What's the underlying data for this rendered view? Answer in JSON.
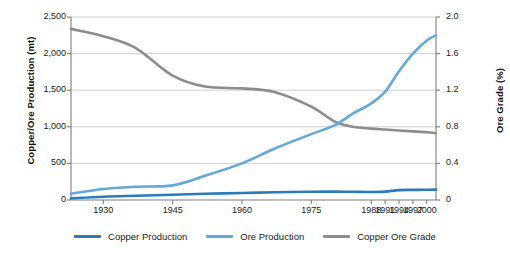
{
  "chart_data": {
    "type": "line",
    "title": "",
    "xlabel": "",
    "ylabel": "Copper/Ore Production (mt)",
    "y2label": "Ore Grade (%)",
    "x_tick_labels": [
      "1930",
      "1945",
      "1960",
      "1975",
      "1988",
      "1991",
      "1994",
      "1997",
      "2000"
    ],
    "x_tick_values": [
      1930,
      1945,
      1960,
      1975,
      1988,
      1991,
      1994,
      1997,
      2000
    ],
    "xlim": [
      1923,
      2002
    ],
    "ylim": [
      0,
      2500
    ],
    "y2lim": [
      0,
      2.0
    ],
    "y_tick_labels": [
      "0",
      "500",
      "1,000",
      "1,500",
      "2,000",
      "2,500"
    ],
    "y_tick_values": [
      0,
      500,
      1000,
      1500,
      2000,
      2500
    ],
    "y2_tick_labels": [
      "0",
      "0.4",
      "0.8",
      "1.2",
      "1.6",
      "2.0"
    ],
    "y2_tick_values": [
      0,
      0.4,
      0.8,
      1.2,
      1.6,
      2.0
    ],
    "grid": true,
    "legend_position": "bottom",
    "series": [
      {
        "name": "Copper Production",
        "color": "#2b7bba",
        "axis": "left",
        "unit": "mt",
        "x": [
          1923,
          1930,
          1937,
          1945,
          1952,
          1960,
          1967,
          1975,
          1980,
          1984,
          1988,
          1991,
          1994,
          1997,
          2000,
          2002
        ],
        "values": [
          22,
          45,
          58,
          72,
          85,
          95,
          105,
          112,
          115,
          112,
          110,
          115,
          135,
          138,
          140,
          142
        ]
      },
      {
        "name": "Ore Production",
        "color": "#64a8d8",
        "axis": "left",
        "unit": "mt",
        "x": [
          1923,
          1930,
          1937,
          1945,
          1952,
          1960,
          1967,
          1975,
          1980,
          1984,
          1988,
          1991,
          1994,
          1997,
          2000,
          2002
        ],
        "values": [
          85,
          150,
          180,
          200,
          330,
          500,
          700,
          900,
          1020,
          1180,
          1320,
          1480,
          1760,
          2000,
          2180,
          2250
        ]
      },
      {
        "name": "Copper Ore Grade",
        "color": "#8c8c8c",
        "axis": "right",
        "unit": "%",
        "x": [
          1923,
          1930,
          1937,
          1945,
          1952,
          1960,
          1967,
          1975,
          1980,
          1984,
          1988,
          1991,
          1994,
          1997,
          2000,
          2002
        ],
        "values": [
          1.87,
          1.79,
          1.66,
          1.36,
          1.24,
          1.22,
          1.18,
          1.02,
          0.86,
          0.8,
          0.78,
          0.77,
          0.76,
          0.75,
          0.74,
          0.73
        ],
        "values_left_scale": [
          2340,
          2240,
          2070,
          1700,
          1550,
          1525,
          1475,
          1280,
          1075,
          1000,
          975,
          960,
          950,
          935,
          925,
          915
        ]
      }
    ]
  },
  "legend": {
    "items": [
      {
        "label": "Copper Production",
        "color": "#2b7bba"
      },
      {
        "label": "Ore Production",
        "color": "#64a8d8"
      },
      {
        "label": "Copper Ore Grade",
        "color": "#8c8c8c"
      }
    ]
  },
  "colors": {
    "copper_production": "#2b7bba",
    "ore_production": "#64a8d8",
    "ore_grade": "#8c8c8c",
    "gridline": "#c8c8c8",
    "axis": "#7d7d7d",
    "text": "#1a1a1a"
  }
}
